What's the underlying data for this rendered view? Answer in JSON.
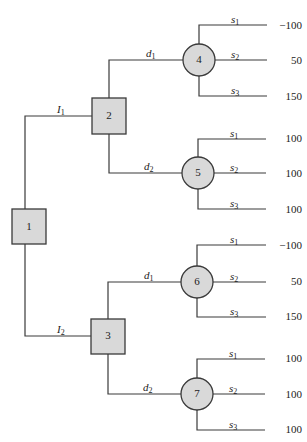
{
  "diagram": {
    "type": "decision-tree",
    "decision_nodes": [
      {
        "id": "1",
        "label": "1",
        "cx": 29,
        "cy": 227
      },
      {
        "id": "2",
        "label": "2",
        "cx": 109,
        "cy": 116
      },
      {
        "id": "3",
        "label": "3",
        "cx": 108,
        "cy": 336
      }
    ],
    "chance_nodes": [
      {
        "id": "4",
        "label": "4",
        "cx": 199,
        "cy": 60,
        "parent": "2",
        "via": "d1"
      },
      {
        "id": "5",
        "label": "5",
        "cx": 198,
        "cy": 173,
        "parent": "2",
        "via": "d2"
      },
      {
        "id": "6",
        "label": "6",
        "cx": 197,
        "cy": 282,
        "parent": "3",
        "via": "d1"
      },
      {
        "id": "7",
        "label": "7",
        "cx": 197,
        "cy": 394,
        "parent": "3",
        "via": "d2"
      }
    ],
    "edge_labels": {
      "I1": {
        "base": "I",
        "sub": "1"
      },
      "I2": {
        "base": "I",
        "sub": "2"
      },
      "d1": {
        "base": "d",
        "sub": "1"
      },
      "d2": {
        "base": "d",
        "sub": "2"
      }
    },
    "state_labels": [
      {
        "base": "s",
        "sub": "1"
      },
      {
        "base": "s",
        "sub": "2"
      },
      {
        "base": "s",
        "sub": "3"
      }
    ],
    "payoffs": {
      "4": [
        "−100",
        "50",
        "150"
      ],
      "5": [
        "100",
        "100",
        "100"
      ],
      "6": [
        "−100",
        "50",
        "150"
      ],
      "7": [
        "100",
        "100",
        "100"
      ]
    },
    "colors": {
      "node_fill": "#d9d9d9",
      "line": "#3a3a3a",
      "background": "#ffffff"
    }
  }
}
